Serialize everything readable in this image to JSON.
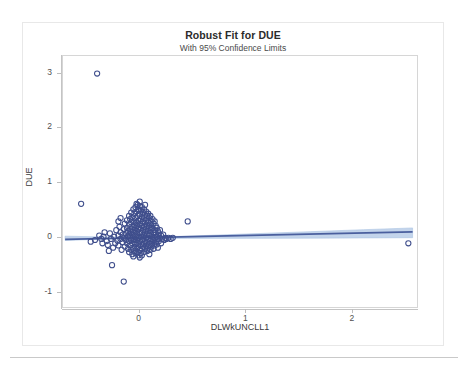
{
  "chart_data": {
    "type": "scatter",
    "title": "Robust Fit for DUE",
    "subtitle": "With 95% Confidence Limits",
    "xlabel": "DLWkUNCLL1",
    "ylabel": "DUE",
    "xlim": [
      -0.72,
      2.62
    ],
    "ylim": [
      -1.3,
      3.32
    ],
    "xticks": [
      0,
      1,
      2
    ],
    "xtick_labels": [
      "0",
      "1",
      "2"
    ],
    "yticks": [
      -1,
      0,
      1,
      2,
      3
    ],
    "ytick_labels": [
      "-1",
      "0",
      "1",
      "2",
      "3"
    ],
    "grid": false,
    "legend": false,
    "marker": "open-circle",
    "marker_color": "#3f4e8c",
    "fit_line_color": "#4a5f9e",
    "confidence_band_color": "#b9cde8",
    "fit_line": {
      "name": "Robust fit",
      "intercept": 0.0,
      "slope": 0.042,
      "x_start": -0.7,
      "x_end": 2.56
    },
    "confidence_band": {
      "name": "95% Confidence Limits",
      "level": 0.95,
      "x": [
        -0.7,
        -0.35,
        0.0,
        0.45,
        1.0,
        1.6,
        2.1,
        2.56
      ],
      "upper": [
        0.03,
        0.016,
        0.012,
        0.03,
        0.07,
        0.112,
        0.148,
        0.18
      ],
      "lower": [
        -0.048,
        -0.026,
        -0.014,
        -0.01,
        -0.01,
        -0.006,
        -0.002,
        0.002
      ]
    },
    "series": [
      {
        "name": "DUE observations",
        "points": [
          [
            -0.4,
            3.0
          ],
          [
            -0.55,
            0.62
          ],
          [
            0.45,
            0.3
          ],
          [
            2.52,
            -0.1
          ],
          [
            -0.26,
            -0.5
          ],
          [
            -0.15,
            -0.8
          ],
          [
            -0.46,
            -0.07
          ],
          [
            -0.3,
            -0.13
          ],
          [
            -0.34,
            0.02
          ],
          [
            -0.31,
            -0.06
          ],
          [
            -0.28,
            0.08
          ],
          [
            -0.27,
            -0.02
          ],
          [
            -0.25,
            -0.18
          ],
          [
            -0.24,
            0.02
          ],
          [
            -0.23,
            -0.1
          ],
          [
            -0.22,
            0.14
          ],
          [
            -0.21,
            -0.05
          ],
          [
            -0.2,
            0.04
          ],
          [
            -0.2,
            -0.14
          ],
          [
            -0.19,
            0.2
          ],
          [
            -0.18,
            -0.02
          ],
          [
            -0.18,
            0.1
          ],
          [
            -0.17,
            -0.22
          ],
          [
            -0.16,
            0.06
          ],
          [
            -0.16,
            -0.08
          ],
          [
            -0.15,
            0.16
          ],
          [
            -0.15,
            0.0
          ],
          [
            -0.14,
            -0.16
          ],
          [
            -0.14,
            0.26
          ],
          [
            -0.13,
            0.08
          ],
          [
            -0.13,
            -0.04
          ],
          [
            -0.12,
            0.32
          ],
          [
            -0.12,
            0.18
          ],
          [
            -0.12,
            -0.1
          ],
          [
            -0.11,
            0.02
          ],
          [
            -0.11,
            -0.2
          ],
          [
            -0.11,
            0.12
          ],
          [
            -0.1,
            0.4
          ],
          [
            -0.1,
            0.24
          ],
          [
            -0.1,
            0.06
          ],
          [
            -0.1,
            -0.06
          ],
          [
            -0.1,
            -0.26
          ],
          [
            -0.09,
            0.34
          ],
          [
            -0.09,
            0.16
          ],
          [
            -0.09,
            0.0
          ],
          [
            -0.09,
            -0.14
          ],
          [
            -0.08,
            0.46
          ],
          [
            -0.08,
            0.28
          ],
          [
            -0.08,
            0.1
          ],
          [
            -0.08,
            -0.04
          ],
          [
            -0.08,
            -0.22
          ],
          [
            -0.07,
            0.38
          ],
          [
            -0.07,
            0.2
          ],
          [
            -0.07,
            0.04
          ],
          [
            -0.07,
            -0.1
          ],
          [
            -0.07,
            -0.3
          ],
          [
            -0.06,
            0.52
          ],
          [
            -0.06,
            0.3
          ],
          [
            -0.06,
            0.14
          ],
          [
            -0.06,
            -0.02
          ],
          [
            -0.06,
            -0.18
          ],
          [
            -0.05,
            0.44
          ],
          [
            -0.05,
            0.24
          ],
          [
            -0.05,
            0.08
          ],
          [
            -0.05,
            -0.08
          ],
          [
            -0.05,
            -0.24
          ],
          [
            -0.04,
            0.56
          ],
          [
            -0.04,
            0.36
          ],
          [
            -0.04,
            0.18
          ],
          [
            -0.04,
            0.02
          ],
          [
            -0.04,
            -0.12
          ],
          [
            -0.04,
            -0.28
          ],
          [
            -0.03,
            0.48
          ],
          [
            -0.03,
            0.28
          ],
          [
            -0.03,
            0.12
          ],
          [
            -0.03,
            -0.04
          ],
          [
            -0.03,
            -0.2
          ],
          [
            -0.02,
            0.6
          ],
          [
            -0.02,
            0.4
          ],
          [
            -0.02,
            0.22
          ],
          [
            -0.02,
            0.06
          ],
          [
            -0.02,
            -0.1
          ],
          [
            -0.02,
            -0.26
          ],
          [
            -0.01,
            0.52
          ],
          [
            -0.01,
            0.32
          ],
          [
            -0.01,
            0.16
          ],
          [
            -0.01,
            0.0
          ],
          [
            -0.01,
            -0.16
          ],
          [
            -0.01,
            -0.32
          ],
          [
            0.0,
            0.58
          ],
          [
            0.0,
            0.44
          ],
          [
            0.0,
            0.26
          ],
          [
            0.0,
            0.1
          ],
          [
            0.0,
            -0.06
          ],
          [
            0.0,
            -0.22
          ],
          [
            0.0,
            -0.36
          ],
          [
            0.01,
            0.5
          ],
          [
            0.01,
            0.34
          ],
          [
            0.01,
            0.18
          ],
          [
            0.01,
            0.02
          ],
          [
            0.01,
            -0.12
          ],
          [
            0.01,
            -0.28
          ],
          [
            0.02,
            0.56
          ],
          [
            0.02,
            0.38
          ],
          [
            0.02,
            0.22
          ],
          [
            0.02,
            0.08
          ],
          [
            0.02,
            -0.04
          ],
          [
            0.02,
            -0.2
          ],
          [
            0.03,
            0.46
          ],
          [
            0.03,
            0.3
          ],
          [
            0.03,
            0.14
          ],
          [
            0.03,
            -0.02
          ],
          [
            0.03,
            -0.16
          ],
          [
            0.04,
            0.52
          ],
          [
            0.04,
            0.36
          ],
          [
            0.04,
            0.2
          ],
          [
            0.04,
            0.04
          ],
          [
            0.04,
            -0.1
          ],
          [
            0.04,
            -0.26
          ],
          [
            0.05,
            0.42
          ],
          [
            0.05,
            0.26
          ],
          [
            0.05,
            0.1
          ],
          [
            0.05,
            -0.06
          ],
          [
            0.05,
            -0.2
          ],
          [
            0.06,
            0.48
          ],
          [
            0.06,
            0.32
          ],
          [
            0.06,
            0.16
          ],
          [
            0.06,
            0.0
          ],
          [
            0.06,
            -0.14
          ],
          [
            0.07,
            0.4
          ],
          [
            0.07,
            0.22
          ],
          [
            0.07,
            0.06
          ],
          [
            0.07,
            -0.08
          ],
          [
            0.07,
            -0.24
          ],
          [
            0.08,
            0.44
          ],
          [
            0.08,
            0.28
          ],
          [
            0.08,
            0.12
          ],
          [
            0.08,
            -0.02
          ],
          [
            0.08,
            -0.18
          ],
          [
            0.09,
            0.36
          ],
          [
            0.09,
            0.18
          ],
          [
            0.09,
            0.04
          ],
          [
            0.09,
            -0.12
          ],
          [
            0.1,
            0.4
          ],
          [
            0.1,
            0.24
          ],
          [
            0.1,
            0.08
          ],
          [
            0.1,
            -0.06
          ],
          [
            0.1,
            -0.22
          ],
          [
            0.11,
            0.3
          ],
          [
            0.11,
            0.14
          ],
          [
            0.11,
            -0.02
          ],
          [
            0.11,
            -0.16
          ],
          [
            0.12,
            0.34
          ],
          [
            0.12,
            0.18
          ],
          [
            0.12,
            0.02
          ],
          [
            0.12,
            -0.1
          ],
          [
            0.13,
            0.26
          ],
          [
            0.13,
            0.1
          ],
          [
            0.13,
            -0.04
          ],
          [
            0.13,
            -0.2
          ],
          [
            0.14,
            0.3
          ],
          [
            0.14,
            0.14
          ],
          [
            0.14,
            0.0
          ],
          [
            0.14,
            -0.14
          ],
          [
            0.15,
            0.22
          ],
          [
            0.15,
            0.06
          ],
          [
            0.15,
            -0.08
          ],
          [
            0.16,
            0.18
          ],
          [
            0.16,
            0.02
          ],
          [
            0.16,
            -0.12
          ],
          [
            0.17,
            0.12
          ],
          [
            0.17,
            -0.02
          ],
          [
            0.17,
            -0.18
          ],
          [
            0.18,
            0.08
          ],
          [
            0.18,
            -0.06
          ],
          [
            0.19,
            0.14
          ],
          [
            0.19,
            0.0
          ],
          [
            0.2,
            0.04
          ],
          [
            0.2,
            -0.1
          ],
          [
            0.21,
            -0.02
          ],
          [
            0.22,
            0.06
          ],
          [
            0.23,
            -0.04
          ],
          [
            0.24,
            0.0
          ],
          [
            0.25,
            -0.02
          ],
          [
            0.27,
            0.0
          ],
          [
            0.29,
            -0.02
          ],
          [
            0.31,
            0.0
          ],
          [
            -0.36,
            -0.02
          ],
          [
            -0.38,
            0.04
          ],
          [
            -0.42,
            -0.04
          ],
          [
            -0.33,
            0.1
          ],
          [
            -0.29,
            -0.24
          ],
          [
            -0.35,
            -0.1
          ],
          [
            -0.2,
            0.3
          ],
          [
            -0.18,
            0.36
          ],
          [
            -0.06,
            -0.34
          ],
          [
            0.02,
            -0.32
          ],
          [
            0.09,
            -0.3
          ],
          [
            0.05,
            0.6
          ],
          [
            -0.03,
            0.62
          ],
          [
            0.0,
            0.66
          ]
        ]
      }
    ]
  }
}
